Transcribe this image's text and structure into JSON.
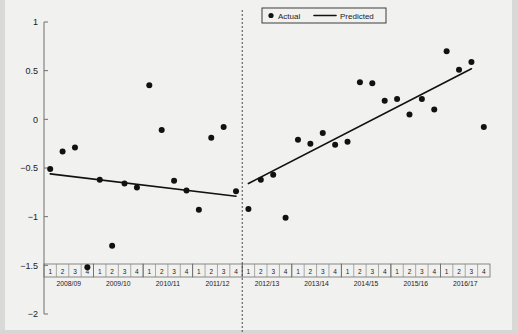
{
  "chart_data": {
    "type": "scatter",
    "title": "",
    "xlabel": "",
    "ylabel": "",
    "ylim": [
      -2,
      1
    ],
    "yticks": [
      1,
      0.5,
      0,
      -0.5,
      -1,
      -1.5,
      -2
    ],
    "ytick_labels": [
      "1",
      "0.5",
      "0",
      "-0.5",
      "-1",
      "-1.5",
      "-2"
    ],
    "grid": false,
    "legend": {
      "position": "top-center",
      "entries": [
        {
          "label": "Actual",
          "marker": "dot",
          "color": "#111111"
        },
        {
          "label": "Predicted",
          "marker": "line",
          "color": "#111111"
        }
      ]
    },
    "x_axis": {
      "quarter_labels": [
        "1",
        "2",
        "3",
        "4"
      ],
      "years": [
        "2008/09",
        "2009/10",
        "2010/11",
        "2011/12",
        "2012/13",
        "2013/14",
        "2014/15",
        "2015/16",
        "2016/17"
      ],
      "n_quarters": 36
    },
    "annotations": [
      {
        "type": "vertical-dashed-line",
        "at_x_index": 16,
        "label": "structural break between 2011/12 Q4 and 2012/13 Q1"
      }
    ],
    "series": [
      {
        "name": "Actual",
        "marker": "dot",
        "points": [
          {
            "x": 0,
            "period": "2008/09 Q1",
            "y": -0.51
          },
          {
            "x": 1,
            "period": "2008/09 Q2",
            "y": -0.33
          },
          {
            "x": 2,
            "period": "2008/09 Q3",
            "y": -0.29
          },
          {
            "x": 3,
            "period": "2008/09 Q4",
            "y": -1.52
          },
          {
            "x": 4,
            "period": "2009/10 Q1",
            "y": -0.62
          },
          {
            "x": 5,
            "period": "2009/10 Q2",
            "y": -1.3
          },
          {
            "x": 6,
            "period": "2009/10 Q3",
            "y": -0.66
          },
          {
            "x": 7,
            "period": "2009/10 Q4",
            "y": -0.7
          },
          {
            "x": 8,
            "period": "2010/11 Q1",
            "y": 0.35
          },
          {
            "x": 9,
            "period": "2010/11 Q2",
            "y": -0.11
          },
          {
            "x": 10,
            "period": "2010/11 Q3",
            "y": -0.63
          },
          {
            "x": 11,
            "period": "2010/11 Q4",
            "y": -0.73
          },
          {
            "x": 12,
            "period": "2011/12 Q1",
            "y": -0.93
          },
          {
            "x": 13,
            "period": "2011/12 Q2",
            "y": -0.19
          },
          {
            "x": 14,
            "period": "2011/12 Q3",
            "y": -0.08
          },
          {
            "x": 15,
            "period": "2011/12 Q4",
            "y": -0.74
          },
          {
            "x": 16,
            "period": "2012/13 Q1",
            "y": -0.92
          },
          {
            "x": 17,
            "period": "2012/13 Q2",
            "y": -0.62
          },
          {
            "x": 18,
            "period": "2012/13 Q3",
            "y": -0.57
          },
          {
            "x": 19,
            "period": "2012/13 Q4",
            "y": -1.01
          },
          {
            "x": 20,
            "period": "2013/14 Q1",
            "y": -0.21
          },
          {
            "x": 21,
            "period": "2013/14 Q2",
            "y": -0.25
          },
          {
            "x": 22,
            "period": "2013/14 Q3",
            "y": -0.14
          },
          {
            "x": 23,
            "period": "2013/14 Q4",
            "y": -0.26
          },
          {
            "x": 24,
            "period": "2014/15 Q1",
            "y": -0.23
          },
          {
            "x": 25,
            "period": "2014/15 Q2",
            "y": 0.38
          },
          {
            "x": 26,
            "period": "2014/15 Q3",
            "y": 0.37
          },
          {
            "x": 27,
            "period": "2014/15 Q4",
            "y": 0.19
          },
          {
            "x": 28,
            "period": "2015/16 Q1",
            "y": 0.21
          },
          {
            "x": 29,
            "period": "2015/16 Q2",
            "y": 0.05
          },
          {
            "x": 30,
            "period": "2015/16 Q3",
            "y": 0.21
          },
          {
            "x": 31,
            "period": "2015/16 Q4",
            "y": 0.1
          },
          {
            "x": 32,
            "period": "2016/17 Q1",
            "y": 0.7
          },
          {
            "x": 33,
            "period": "2016/17 Q2",
            "y": 0.51
          },
          {
            "x": 34,
            "period": "2016/17 Q3",
            "y": 0.59
          },
          {
            "x": 35,
            "period": "2016/17 Q4",
            "y": -0.08
          }
        ]
      },
      {
        "name": "Predicted",
        "marker": "line",
        "segments": [
          {
            "name": "pre-break-trend",
            "x_start": 0,
            "y_start": -0.56,
            "x_end": 15,
            "y_end": -0.79
          },
          {
            "name": "post-break-trend",
            "x_start": 16,
            "y_start": -0.66,
            "x_end": 34,
            "y_end": 0.52
          }
        ]
      }
    ]
  }
}
